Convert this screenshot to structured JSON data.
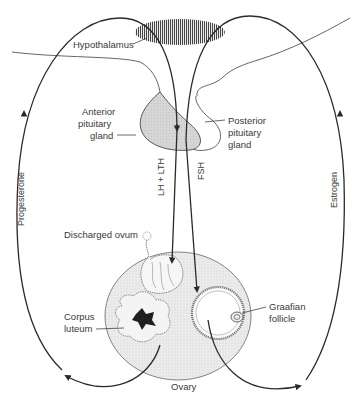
{
  "diagram": {
    "type": "hormonal-feedback-cycle",
    "labels": {
      "hypothalamus": "Hypothalamus",
      "anterior_pituitary": [
        "Anterior",
        "pituitary",
        "gland"
      ],
      "posterior_pituitary": [
        "Posterior",
        "pituitary",
        "gland"
      ],
      "lh_lth": "LH + LTH",
      "fsh": "FSH",
      "discharged_ovum": "Discharged ovum",
      "corpus_luteum": [
        "Corpus",
        "luteum"
      ],
      "graafian_follicle": [
        "Graafian",
        "follicle"
      ],
      "ovary": "Ovary",
      "progesterone": "Progesterone",
      "estrogen": "Estrogen"
    },
    "nodes": [
      {
        "id": "hypothalamus",
        "label": "Hypothalamus"
      },
      {
        "id": "anterior-pituitary",
        "label": "Anterior pituitary gland"
      },
      {
        "id": "posterior-pituitary",
        "label": "Posterior pituitary gland"
      },
      {
        "id": "ovary",
        "label": "Ovary"
      },
      {
        "id": "discharged-ovum",
        "label": "Discharged ovum"
      },
      {
        "id": "corpus-luteum",
        "label": "Corpus luteum"
      },
      {
        "id": "graafian-follicle",
        "label": "Graafian follicle"
      }
    ],
    "edges": [
      {
        "from": "anterior-pituitary",
        "to": "discharged-ovum",
        "label": "LH + LTH"
      },
      {
        "from": "anterior-pituitary",
        "to": "graafian-follicle",
        "label": "FSH"
      },
      {
        "from": "corpus-luteum",
        "to": "hypothalamus",
        "label": "Progesterone"
      },
      {
        "from": "graafian-follicle",
        "to": "hypothalamus",
        "label": "Estrogen"
      }
    ],
    "colors": {
      "line": "#2a2a2a",
      "thin_line": "#555555",
      "pituitary_fill": "#d4d4d4",
      "ovary_fill": "#ececec",
      "text": "#3a3a3a"
    }
  }
}
